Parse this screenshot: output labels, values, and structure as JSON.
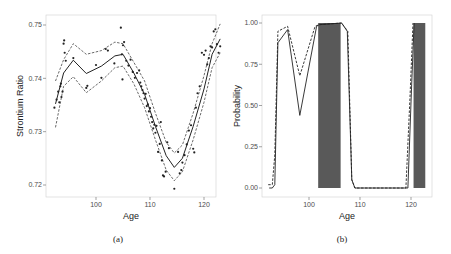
{
  "chart_data": [
    {
      "panel": "(a)",
      "type": "scatter",
      "title": "",
      "xlabel": "Age",
      "ylabel": "Strontium Ratio",
      "xlim": [
        91,
        124
      ],
      "ylim": [
        0.718,
        0.752
      ],
      "xticks": [
        "100",
        "110",
        "120"
      ],
      "yticks": [
        "0.72",
        "0.73",
        "0.74",
        "0.75"
      ],
      "grid": false,
      "series": [
        {
          "name": "fitted mean",
          "style": "solid",
          "x": [
            92.5,
            94,
            95.8,
            98.2,
            101,
            103.5,
            105,
            107,
            109,
            111,
            113,
            114.5,
            116,
            118,
            120,
            121.5,
            123
          ],
          "values": [
            0.7352,
            0.741,
            0.7434,
            0.7409,
            0.7423,
            0.7442,
            0.7445,
            0.741,
            0.737,
            0.731,
            0.7255,
            0.7233,
            0.725,
            0.731,
            0.738,
            0.7445,
            0.7474
          ]
        },
        {
          "name": "upper band",
          "style": "dashed",
          "x": [
            92.5,
            94,
            95.8,
            98.2,
            101,
            103.5,
            105,
            107,
            109,
            111,
            113,
            114.5,
            116,
            118,
            120,
            121.5,
            123
          ],
          "values": [
            0.7395,
            0.7435,
            0.7465,
            0.7445,
            0.7452,
            0.7468,
            0.7465,
            0.743,
            0.7395,
            0.7335,
            0.728,
            0.726,
            0.7275,
            0.7335,
            0.7405,
            0.7465,
            0.7502
          ]
        },
        {
          "name": "lower band",
          "style": "dashed",
          "x": [
            92.5,
            94,
            95.8,
            98.2,
            101,
            103.5,
            105,
            107,
            109,
            111,
            113,
            114.5,
            116,
            118,
            120,
            121.5,
            123
          ],
          "values": [
            0.7308,
            0.7385,
            0.7403,
            0.7373,
            0.7395,
            0.742,
            0.7423,
            0.739,
            0.7345,
            0.7285,
            0.7228,
            0.7208,
            0.7225,
            0.7285,
            0.7355,
            0.742,
            0.7448
          ]
        },
        {
          "name": "observations",
          "style": "points",
          "x": [
            92.3,
            92.7,
            93,
            93.2,
            93.4,
            93.5,
            93.6,
            93.8,
            94,
            94.1,
            94.2,
            94.4,
            95.8,
            98.2,
            98.4,
            100,
            101,
            101.8,
            102.2,
            103.4,
            104.6,
            104.8,
            104.9,
            105,
            105.2,
            105.6,
            106,
            106.4,
            106.8,
            107.2,
            107.6,
            108,
            108.2,
            108.4,
            108.6,
            108.8,
            109,
            109.2,
            109.4,
            109.6,
            109.8,
            110,
            110.2,
            110.4,
            110.6,
            110.8,
            111,
            111.2,
            111.5,
            111.8,
            112,
            112.2,
            112.4,
            112.6,
            112.9,
            113.2,
            113.5,
            114.5,
            115.2,
            115.5,
            115.8,
            116,
            116.4,
            116.8,
            117.2,
            117.6,
            118,
            118.2,
            118.5,
            118.8,
            119.2,
            119.6,
            120,
            120.3,
            120.6,
            120.9,
            121.2,
            121.5,
            121.8,
            122.1,
            122.4,
            122.7,
            123
          ],
          "values": [
            0.7345,
            0.736,
            0.7375,
            0.7355,
            0.7385,
            0.739,
            0.7365,
            0.7375,
            0.7465,
            0.7471,
            0.7448,
            0.7433,
            0.7438,
            0.7382,
            0.7386,
            0.7425,
            0.7401,
            0.7455,
            0.7452,
            0.7428,
            0.7495,
            0.7445,
            0.7398,
            0.7462,
            0.7468,
            0.7433,
            0.7424,
            0.7435,
            0.7412,
            0.7401,
            0.741,
            0.7415,
            0.7392,
            0.7385,
            0.7378,
            0.7372,
            0.7362,
            0.7371,
            0.7348,
            0.7351,
            0.7338,
            0.7344,
            0.7328,
            0.7318,
            0.7306,
            0.7313,
            0.7298,
            0.7311,
            0.7262,
            0.7277,
            0.7318,
            0.7246,
            0.7218,
            0.7216,
            0.7225,
            0.728,
            0.7269,
            0.7193,
            0.7262,
            0.7222,
            0.7228,
            0.7242,
            0.7256,
            0.7276,
            0.7302,
            0.7312,
            0.7268,
            0.7261,
            0.7345,
            0.7372,
            0.7385,
            0.7448,
            0.7444,
            0.7452,
            0.7426,
            0.7438,
            0.746,
            0.7458,
            0.7488,
            0.7492,
            0.7464,
            0.7448,
            0.746
          ]
        }
      ]
    },
    {
      "panel": "(b)",
      "type": "line",
      "title": "",
      "xlabel": "Age",
      "ylabel": "Probability",
      "xlim": [
        91,
        124
      ],
      "ylim": [
        -0.05,
        1.05
      ],
      "xticks": [
        "100",
        "110",
        "120"
      ],
      "yticks": [
        "0.00",
        "0.25",
        "0.50",
        "0.75",
        "1.00"
      ],
      "grid": false,
      "series": [
        {
          "name": "probability (solid)",
          "style": "solid",
          "x": [
            92.2,
            92.8,
            93.3,
            93.9,
            95.8,
            98.2,
            101.5,
            102,
            106.4,
            107.5,
            108.4,
            109,
            119.4,
            120.1,
            120.6
          ],
          "values": [
            0.0,
            0.0,
            0.02,
            0.88,
            0.96,
            0.44,
            0.98,
            0.99,
            1.0,
            0.95,
            0.05,
            0.0,
            0.0,
            0.6,
            1.0
          ]
        },
        {
          "name": "probability (dashed)",
          "style": "dashed",
          "x": [
            92.0,
            92.8,
            93.3,
            93.9,
            95.8,
            98.2,
            101.2,
            102,
            106.4,
            107.6,
            108.4,
            109,
            119.0,
            119.8,
            120.4
          ],
          "values": [
            0.02,
            0.02,
            0.2,
            0.95,
            0.98,
            0.68,
            0.98,
            0.99,
            1.0,
            0.95,
            0.05,
            0.0,
            0.0,
            0.55,
            1.0
          ]
        }
      ],
      "shaded_regions": [
        {
          "x_start": 101.8,
          "x_end": 106.2,
          "y_start": 0.0,
          "y_end": 1.0,
          "color": "#595959"
        },
        {
          "x_start": 120.5,
          "x_end": 122.8,
          "y_start": 0.0,
          "y_end": 1.0,
          "color": "#595959"
        }
      ]
    }
  ],
  "captions": {
    "a": "(a)",
    "b": "(b)"
  },
  "colors": {
    "line": "#222222",
    "band": "#444444",
    "points": "#222222",
    "shade": "#595959",
    "frame": "#cccccc"
  }
}
